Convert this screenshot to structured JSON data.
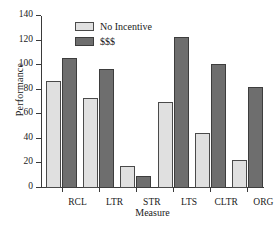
{
  "chart_data": {
    "type": "bar",
    "title": "",
    "subtitle": "",
    "xlabel": "Measure",
    "ylabel": "Performance",
    "categories": [
      "RCL",
      "LTR",
      "STR",
      "LTS",
      "CLTR",
      "ORG"
    ],
    "series": [
      {
        "name": "No Incentive",
        "values": [
          87,
          73,
          18,
          70,
          45,
          23
        ],
        "color": "#e0e0e0"
      },
      {
        "name": "$$$",
        "values": [
          106,
          97,
          10,
          123,
          101,
          82
        ],
        "color": "#6e6e6e"
      }
    ],
    "ylim": [
      0,
      140
    ],
    "yticks": [
      0,
      20,
      40,
      60,
      80,
      100,
      120,
      140
    ],
    "ytick_labels": [
      "0",
      "20",
      "40",
      "60",
      "80",
      "100",
      "120",
      "140"
    ],
    "grid": false,
    "legend_position": "top-left-inside",
    "axis_color": "#3a3a3a"
  },
  "legend": {
    "entries": [
      {
        "label": "No Incentive",
        "swatch": "light-gray-swatch"
      },
      {
        "label": "$$$",
        "swatch": "dark-gray-swatch"
      }
    ]
  }
}
